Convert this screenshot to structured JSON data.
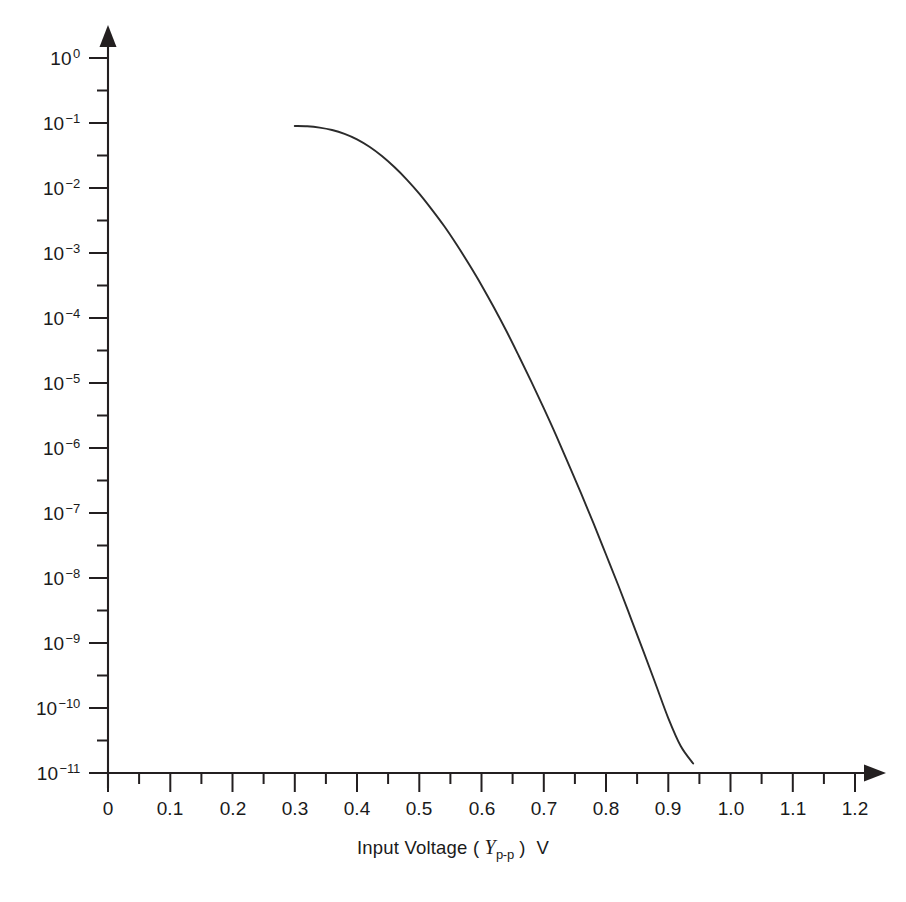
{
  "figure": {
    "background_color": "#ffffff",
    "ink_color": "#231f20",
    "curve_color": "#2b2b2b"
  },
  "axis_title": {
    "prefix": "Input Voltage ( ",
    "variable": "Y",
    "subscript": "p-p",
    "suffix": " )",
    "unit": "V"
  },
  "y_axis": {
    "labels": [
      {
        "mantissa": "10",
        "exponent": "0"
      },
      {
        "mantissa": "10",
        "exponent": "−1"
      },
      {
        "mantissa": "10",
        "exponent": "−2"
      },
      {
        "mantissa": "10",
        "exponent": "−3"
      },
      {
        "mantissa": "10",
        "exponent": "−4"
      },
      {
        "mantissa": "10",
        "exponent": "−5"
      },
      {
        "mantissa": "10",
        "exponent": "−6"
      },
      {
        "mantissa": "10",
        "exponent": "−7"
      },
      {
        "mantissa": "10",
        "exponent": "−8"
      },
      {
        "mantissa": "10",
        "exponent": "−9"
      },
      {
        "mantissa": "10",
        "exponent": "−10"
      },
      {
        "mantissa": "10",
        "exponent": "−11"
      }
    ]
  },
  "x_axis": {
    "labels": [
      "0",
      "0.1",
      "0.2",
      "0.3",
      "0.4",
      "0.5",
      "0.6",
      "0.7",
      "0.8",
      "0.9",
      "1.0",
      "1.1",
      "1.2"
    ]
  },
  "chart_data": {
    "type": "line",
    "title": "",
    "subtitle": "",
    "xlabel": "Input Voltage ( Yp-p ) V",
    "ylabel": "",
    "xlim": [
      0,
      1.2
    ],
    "ylim": [
      1e-11,
      1
    ],
    "yscale": "log",
    "xscale": "linear",
    "grid": false,
    "legend": null,
    "xticks": [
      0,
      0.1,
      0.2,
      0.3,
      0.4,
      0.5,
      0.6,
      0.7,
      0.8,
      0.9,
      1.0,
      1.1,
      1.2
    ],
    "xticks_minor_step": 0.05,
    "yticks": [
      1,
      0.1,
      0.01,
      0.001,
      0.0001,
      1e-05,
      1e-06,
      1e-07,
      1e-08,
      1e-09,
      1e-10,
      1e-11
    ],
    "yticks_minor": "half-decade (5x10^n) between each decade",
    "axis_arrows": [
      "x-right",
      "y-up"
    ],
    "series": [
      {
        "name": "Bit error rate vs input voltage",
        "x": [
          0.3,
          0.32,
          0.34,
          0.36,
          0.38,
          0.4,
          0.42,
          0.44,
          0.46,
          0.48,
          0.5,
          0.52,
          0.54,
          0.56,
          0.58,
          0.6,
          0.62,
          0.64,
          0.66,
          0.68,
          0.7,
          0.72,
          0.74,
          0.76,
          0.78,
          0.8,
          0.82,
          0.84,
          0.86,
          0.88,
          0.9,
          0.92,
          0.94,
          0.96,
          0.98,
          1.0,
          1.02,
          1.04,
          1.06,
          1.08,
          1.1,
          1.12,
          1.14,
          1.16,
          1.18,
          1.2
        ],
        "y": [
          0.09,
          0.089,
          0.085,
          0.078,
          0.068,
          0.056,
          0.043,
          0.031,
          0.021,
          0.0135,
          0.0082,
          0.0047,
          0.0026,
          0.00135,
          0.00067,
          0.00032,
          0.000145,
          6.3e-05,
          2.6e-05,
          1.05e-05,
          4.1e-06,
          1.55e-06,
          5.6e-07,
          2e-07,
          6.9e-08,
          2.3e-08,
          7.6e-09,
          2.4e-09,
          7.5e-10,
          2.3e-10,
          7e-11,
          2.6e-11,
          1.4e-11,
          9e-12,
          6.5e-12,
          5e-12,
          4e-12,
          3.3e-12,
          2.8e-12,
          2.4e-12,
          2.1e-12,
          1.8e-12,
          1.6e-12,
          1.4e-12,
          1.25e-12,
          1.1e-12
        ],
        "note": "Monotonically decreasing waterfall curve; plotted portion spans x=0.30 to x=1.20, ending near 3e-11 at the right edge"
      }
    ]
  },
  "geometry": {
    "origin_px": {
      "x": 108,
      "y": 773
    },
    "x_per_0_1V_px": 62.25,
    "y_per_decade_px": 65.0,
    "y_top_decade_px": 58
  }
}
